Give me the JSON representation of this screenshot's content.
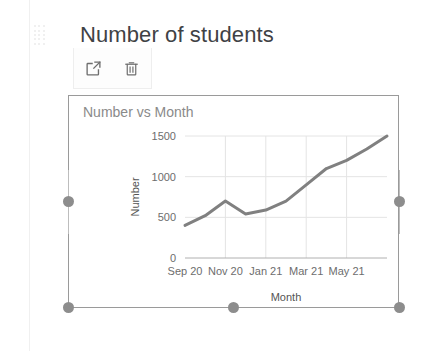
{
  "block": {
    "title": "Number of students",
    "drag_handle_icon": "drag-dots-icon"
  },
  "toolbar": {
    "open_label": "Open in new window",
    "open_icon": "open-in-new-icon",
    "delete_label": "Delete",
    "delete_icon": "trash-icon"
  },
  "selection": {
    "handle_color": "#8d8d8d",
    "border_color": "#9a9a9a",
    "handles": [
      "left-middle",
      "right-middle",
      "bottom-left",
      "bottom-center",
      "bottom-right"
    ]
  },
  "chart_data": {
    "type": "line",
    "title": "Number vs Month",
    "xlabel": "Month",
    "ylabel": "Number",
    "x": [
      "Sep 20",
      "Oct 20",
      "Nov 20",
      "Dec 20",
      "Jan 21",
      "Feb 21",
      "Mar 21",
      "Apr 21",
      "May 21",
      "Jun 21",
      "Jul 21"
    ],
    "values": [
      400,
      520,
      700,
      540,
      590,
      700,
      900,
      1100,
      1200,
      1340,
      1500
    ],
    "xtick_labels": [
      "Sep 20",
      "Nov 20",
      "Jan 21",
      "Mar 21",
      "May 21"
    ],
    "xtick_indices": [
      0,
      2,
      4,
      6,
      8
    ],
    "ytick_labels": [
      "0",
      "500",
      "1000",
      "1500"
    ],
    "ytick_values": [
      0,
      500,
      1000,
      1500
    ],
    "ylim": [
      0,
      1500
    ],
    "grid": true,
    "legend": false,
    "line_color": "#808080",
    "line_width": 3,
    "grid_color": "#e4e4e4",
    "axis_color": "#b0b0b0",
    "tick_label_color": "#6d6d6d",
    "title_color": "#8a8a8a"
  }
}
